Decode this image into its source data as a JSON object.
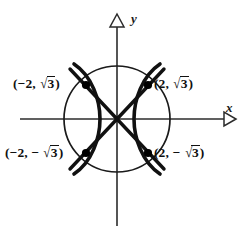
{
  "figure": {
    "type": "math-graph",
    "background_color": "#ffffff",
    "curve_color": "#111111",
    "axis_color": "#2b2b2b"
  },
  "axes": {
    "x_label": "x",
    "y_label": "y",
    "origin_px": {
      "x": 117,
      "y": 119
    },
    "x_arrow_icon": "arrow-right-hollow",
    "y_arrow_icon": "arrow-up-hollow"
  },
  "curves": {
    "circle": {
      "name": "circle",
      "center": [
        0,
        0
      ],
      "radius_px": 53,
      "stroke_width": 1.7
    },
    "hyperbola": {
      "name": "hyperbola",
      "opens": "left-right",
      "vertex_offset_px": 17,
      "stroke_width": 3.6
    },
    "asymptotes": {
      "name": "asymptotes",
      "count": 2,
      "stroke_width": 3.4
    }
  },
  "points": [
    {
      "id": "top-left",
      "label_parts": {
        "prefix": "(−2, ",
        "radical": "√",
        "radicand": "3",
        "suffix": ")"
      },
      "label_text": "(−2, √3)",
      "x_value": -2,
      "y_value": "√3",
      "px": {
        "x": 86,
        "y": 85
      }
    },
    {
      "id": "top-right",
      "label_parts": {
        "prefix": "(2, ",
        "radical": "√",
        "radicand": "3",
        "suffix": ")"
      },
      "label_text": "(2, √3)",
      "x_value": 2,
      "y_value": "√3",
      "px": {
        "x": 148,
        "y": 85
      }
    },
    {
      "id": "bottom-left",
      "label_parts": {
        "prefix": "(−2, − ",
        "radical": "√",
        "radicand": "3",
        "suffix": ")"
      },
      "label_text": "(−2, − √3)",
      "x_value": -2,
      "y_value": "-√3",
      "px": {
        "x": 86,
        "y": 153
      }
    },
    {
      "id": "bottom-right",
      "label_parts": {
        "prefix": "(2, − ",
        "radical": "√",
        "radicand": "3",
        "suffix": ")"
      },
      "label_text": "(2, − √3)",
      "x_value": 2,
      "y_value": "-√3",
      "px": {
        "x": 148,
        "y": 153
      }
    }
  ]
}
